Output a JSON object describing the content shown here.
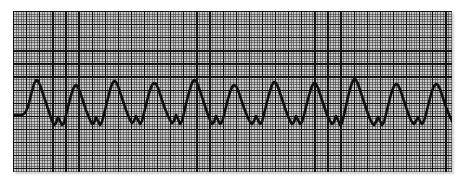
{
  "figure": {
    "kind": "electrocardiogram-rhythm-strip",
    "paper_color": "#c9c9c9",
    "fine_grid_color": "#4a4a4a",
    "bold_grid_color": "#0d0d0d",
    "trace_color": "#101010",
    "background_color": "#ffffff"
  },
  "strip": {
    "left": 13,
    "top": 11,
    "width": 439,
    "height": 161,
    "fine_grid_px": 2.62,
    "bold_grid_px": 13.1,
    "small_boxes_per_large_box": 5
  },
  "chart_data": {
    "type": "line",
    "xlabel": "Time",
    "ylabel": "Amplitude",
    "grid": true,
    "legend": "none",
    "rhythm": "rapid regular wide-complex sawtooth rhythm",
    "complex_count": 22,
    "baseline_y": 103,
    "peak_y": 70,
    "trough_y": 115,
    "xlim": [
      0,
      467
    ],
    "ylim": [
      161,
      0
    ],
    "x": [
      -4,
      2,
      8,
      13,
      16,
      19,
      21,
      23,
      25,
      27,
      29,
      31,
      33,
      35,
      37,
      39,
      41,
      43,
      45,
      47,
      49,
      51,
      53,
      55,
      57,
      59,
      61,
      63,
      65,
      67,
      69,
      71,
      73,
      75,
      77,
      79,
      81,
      83,
      85,
      87,
      89,
      91,
      93,
      95,
      97,
      99,
      101,
      103,
      105,
      107,
      109,
      111,
      113,
      115,
      117,
      119,
      121,
      123,
      125,
      127,
      129,
      131,
      133,
      135,
      137,
      139,
      141,
      143,
      145,
      147,
      149,
      151,
      153,
      155,
      157,
      159,
      161,
      163,
      165,
      167,
      169,
      171,
      173,
      175,
      177,
      179,
      181,
      183,
      185,
      187,
      189,
      191,
      193,
      195,
      197,
      199,
      201,
      203,
      205,
      207,
      209,
      211,
      213,
      215,
      217,
      219,
      221,
      223,
      225,
      227,
      229,
      231,
      233,
      235,
      237,
      239,
      241,
      243,
      245,
      247,
      249,
      251,
      253,
      255,
      257,
      259,
      261,
      263,
      265,
      267,
      269,
      271,
      273,
      275,
      277,
      279,
      281,
      283,
      285,
      287,
      289,
      291,
      293,
      295,
      297,
      299,
      301,
      303,
      305,
      307,
      309,
      311,
      313,
      315,
      317,
      319,
      321,
      323,
      325,
      327,
      329,
      331,
      333,
      335,
      337,
      339,
      341,
      343,
      345,
      347,
      349,
      351,
      353,
      355,
      357,
      359,
      361,
      363,
      365,
      367,
      369,
      371,
      373,
      375,
      377,
      379,
      381,
      383,
      385,
      387,
      389,
      391,
      393,
      395,
      397,
      399,
      401,
      403,
      405,
      407,
      409,
      411,
      413,
      415,
      417,
      419,
      421,
      423,
      425,
      427,
      429,
      431,
      433,
      435,
      437,
      439,
      441,
      443,
      445,
      447,
      449,
      451,
      453,
      455,
      457,
      459,
      461,
      463,
      465,
      467
    ],
    "y": [
      104,
      104,
      104,
      104,
      102,
      96,
      88,
      80,
      73,
      69,
      70,
      74,
      80,
      86,
      92,
      98,
      104,
      110,
      114,
      112,
      106,
      110,
      114,
      112,
      104,
      96,
      88,
      81,
      76,
      74,
      76,
      81,
      87,
      93,
      99,
      104,
      109,
      113,
      112,
      106,
      110,
      114,
      111,
      103,
      95,
      87,
      79,
      73,
      70,
      71,
      75,
      81,
      87,
      93,
      99,
      104,
      109,
      112,
      110,
      105,
      109,
      113,
      110,
      102,
      94,
      86,
      79,
      74,
      72,
      73,
      77,
      83,
      89,
      95,
      100,
      105,
      109,
      112,
      110,
      104,
      108,
      113,
      110,
      102,
      93,
      85,
      78,
      72,
      69,
      70,
      74,
      80,
      86,
      92,
      98,
      104,
      109,
      113,
      111,
      105,
      109,
      113,
      111,
      104,
      96,
      88,
      81,
      76,
      74,
      75,
      79,
      85,
      91,
      97,
      102,
      107,
      111,
      113,
      110,
      105,
      109,
      113,
      111,
      103,
      95,
      87,
      80,
      74,
      71,
      72,
      76,
      82,
      88,
      94,
      100,
      105,
      110,
      113,
      111,
      105,
      109,
      113,
      111,
      104,
      96,
      88,
      81,
      75,
      72,
      73,
      77,
      83,
      89,
      95,
      101,
      106,
      110,
      113,
      111,
      105,
      109,
      114,
      112,
      104,
      95,
      86,
      78,
      72,
      68,
      69,
      73,
      79,
      85,
      91,
      97,
      103,
      108,
      112,
      114,
      111,
      106,
      110,
      114,
      111,
      103,
      95,
      87,
      80,
      75,
      73,
      74,
      78,
      84,
      90,
      96,
      102,
      107,
      111,
      113,
      110,
      106,
      110,
      113,
      110,
      103,
      95,
      87,
      80,
      75,
      73,
      74,
      78,
      84,
      90,
      96,
      101,
      106,
      110,
      113,
      110,
      105,
      109,
      113,
      111,
      103,
      95,
      87,
      80,
      75,
      73,
      74,
      78,
      84,
      90,
      96,
      102
    ]
  }
}
